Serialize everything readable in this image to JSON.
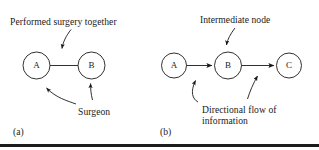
{
  "figure": {
    "background_color": "#ffffff",
    "stroke_color": "#1a1a1a",
    "text_color": "#1a1a1a",
    "bottom_rule_color": "#1c1c1c",
    "bottom_rule_y": 144
  },
  "panels": [
    {
      "tag": "(a)",
      "tag_x": 13,
      "tag_y": 126,
      "caption_top": "Performed surgery together",
      "caption_top_x": 10,
      "caption_top_y": 16,
      "caption_bottom": "Surgeon",
      "caption_bottom_x": 78,
      "caption_bottom_y": 106,
      "nodes": [
        {
          "label": "A",
          "cx": 36.5,
          "cy": 65.5,
          "r": 13.5
        },
        {
          "label": "B",
          "cx": 91.5,
          "cy": 65.5,
          "r": 13.5
        }
      ],
      "edges": [
        {
          "from": "A",
          "to": "B",
          "directed": false
        }
      ]
    },
    {
      "tag": "(b)",
      "tag_x": 160,
      "tag_y": 126,
      "caption_top": "Intermediate node",
      "caption_top_x": 200,
      "caption_top_y": 14,
      "caption_bottom_line1": "Directional flow of",
      "caption_bottom_line2": "information",
      "caption_bottom_x": 202,
      "caption_bottom_y": 104,
      "nodes": [
        {
          "label": "A",
          "cx": 174,
          "cy": 65.5,
          "r": 12.5
        },
        {
          "label": "B",
          "cx": 228,
          "cy": 65.5,
          "r": 13.5
        },
        {
          "label": "C",
          "cx": 289,
          "cy": 65.5,
          "r": 12.5
        }
      ],
      "edges": [
        {
          "from": "A",
          "to": "B",
          "directed": true
        },
        {
          "from": "B",
          "to": "C",
          "directed": true
        }
      ]
    }
  ],
  "annotations": [
    {
      "name": "performed-surgery-together-pointer",
      "target": "edge-a-b",
      "style": "curved-arrow"
    },
    {
      "name": "surgeon-pointer-left",
      "target": "node-a",
      "style": "curved-arrow"
    },
    {
      "name": "surgeon-pointer-right",
      "target": "node-b",
      "style": "curved-arrow"
    },
    {
      "name": "intermediate-node-pointer",
      "target": "node-b2",
      "style": "curved-arrow"
    },
    {
      "name": "directional-flow-pointer-left",
      "target": "edge-a-b2",
      "style": "curved-arrow"
    },
    {
      "name": "directional-flow-pointer-right",
      "target": "edge-b-c",
      "style": "curved-arrow"
    }
  ]
}
